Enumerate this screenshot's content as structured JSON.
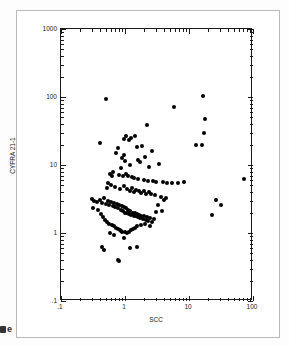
{
  "chart_data": {
    "type": "scatter",
    "title": "",
    "xlabel": "SCC",
    "ylabel": "CYFRA 21-1",
    "xscale": "log",
    "yscale": "log",
    "xlim": [
      0.1,
      100
    ],
    "ylim": [
      0.1,
      1000
    ],
    "grid": false,
    "legend": null,
    "marker": "filled-circle",
    "marker_color": "#000000",
    "x_tick_labels": [
      ".1",
      "1",
      "10",
      "100"
    ],
    "x_tick_values": [
      0.1,
      1,
      10,
      100
    ],
    "y_tick_labels": [
      ".1",
      "1",
      "10",
      "100",
      "1000"
    ],
    "y_tick_values": [
      0.1,
      1,
      10,
      100,
      1000
    ],
    "n_points": 152,
    "points": [
      [
        0.5,
        92.0
      ],
      [
        0.41,
        21.0
      ],
      [
        5.9,
        72.0
      ],
      [
        16.5,
        105.0
      ],
      [
        18.0,
        48.0
      ],
      [
        17.0,
        30.0
      ],
      [
        16.0,
        20.0
      ],
      [
        13.0,
        20.0
      ],
      [
        2.2,
        39.0
      ],
      [
        1.45,
        27.0
      ],
      [
        1.05,
        27.0
      ],
      [
        1.25,
        25.0
      ],
      [
        0.95,
        24.0
      ],
      [
        1.15,
        23.0
      ],
      [
        0.78,
        18.0
      ],
      [
        1.85,
        19.0
      ],
      [
        1.55,
        18.5
      ],
      [
        2.6,
        16.0
      ],
      [
        0.72,
        15.0
      ],
      [
        0.98,
        14.0
      ],
      [
        0.9,
        12.5
      ],
      [
        1.0,
        11.5
      ],
      [
        1.6,
        12.0
      ],
      [
        1.7,
        11.0
      ],
      [
        2.05,
        13.0
      ],
      [
        3.4,
        10.5
      ],
      [
        2.4,
        9.5
      ],
      [
        1.2,
        10.0
      ],
      [
        0.88,
        9.0
      ],
      [
        0.66,
        8.0
      ],
      [
        0.58,
        7.5
      ],
      [
        0.62,
        7.0
      ],
      [
        0.8,
        7.2
      ],
      [
        0.93,
        6.8
      ],
      [
        1.1,
        6.9
      ],
      [
        1.02,
        7.4
      ],
      [
        1.3,
        6.6
      ],
      [
        1.4,
        6.4
      ],
      [
        1.62,
        6.2
      ],
      [
        1.95,
        6.0
      ],
      [
        2.25,
        5.9
      ],
      [
        2.75,
        5.8
      ],
      [
        3.1,
        5.6
      ],
      [
        3.9,
        5.7
      ],
      [
        4.6,
        5.5
      ],
      [
        5.4,
        5.4
      ],
      [
        6.8,
        5.5
      ],
      [
        8.5,
        5.6
      ],
      [
        72.0,
        6.2
      ],
      [
        0.55,
        5.4
      ],
      [
        0.6,
        5.0
      ],
      [
        0.52,
        4.6
      ],
      [
        0.7,
        4.8
      ],
      [
        0.85,
        4.5
      ],
      [
        0.96,
        4.9
      ],
      [
        1.08,
        4.4
      ],
      [
        1.18,
        4.2
      ],
      [
        1.28,
        4.6
      ],
      [
        1.38,
        4.0
      ],
      [
        1.5,
        4.3
      ],
      [
        1.68,
        4.1
      ],
      [
        1.8,
        3.9
      ],
      [
        2.0,
        4.2
      ],
      [
        2.15,
        3.8
      ],
      [
        2.35,
        4.0
      ],
      [
        2.55,
        3.7
      ],
      [
        2.9,
        3.6
      ],
      [
        3.6,
        3.4
      ],
      [
        4.3,
        3.3
      ],
      [
        0.3,
        3.2
      ],
      [
        0.33,
        3.0
      ],
      [
        0.36,
        2.9
      ],
      [
        0.4,
        3.1
      ],
      [
        0.44,
        2.8
      ],
      [
        0.47,
        3.3
      ],
      [
        0.51,
        2.7
      ],
      [
        0.54,
        3.0
      ],
      [
        0.57,
        2.6
      ],
      [
        0.61,
        2.9
      ],
      [
        0.65,
        2.5
      ],
      [
        0.68,
        2.8
      ],
      [
        0.71,
        2.4
      ],
      [
        0.75,
        2.7
      ],
      [
        0.79,
        2.3
      ],
      [
        0.82,
        2.6
      ],
      [
        0.86,
        2.2
      ],
      [
        0.89,
        2.5
      ],
      [
        0.92,
        2.1
      ],
      [
        0.97,
        2.4
      ],
      [
        1.01,
        2.0
      ],
      [
        1.04,
        2.3
      ],
      [
        1.07,
        1.95
      ],
      [
        1.12,
        2.2
      ],
      [
        1.16,
        1.9
      ],
      [
        1.21,
        2.1
      ],
      [
        1.26,
        1.85
      ],
      [
        1.32,
        2.0
      ],
      [
        1.36,
        1.8
      ],
      [
        1.42,
        1.95
      ],
      [
        1.47,
        1.75
      ],
      [
        1.53,
        1.9
      ],
      [
        1.58,
        1.7
      ],
      [
        1.65,
        1.85
      ],
      [
        1.72,
        1.65
      ],
      [
        1.78,
        1.8
      ],
      [
        1.88,
        1.6
      ],
      [
        1.98,
        1.75
      ],
      [
        2.1,
        1.55
      ],
      [
        2.2,
        1.7
      ],
      [
        2.3,
        1.5
      ],
      [
        2.45,
        1.65
      ],
      [
        2.6,
        1.45
      ],
      [
        2.8,
        1.6
      ],
      [
        3.0,
        2.05
      ],
      [
        3.3,
        2.6
      ],
      [
        3.8,
        2.1
      ],
      [
        4.0,
        3.1
      ],
      [
        0.32,
        2.35
      ],
      [
        0.38,
        2.15
      ],
      [
        0.42,
        1.9
      ],
      [
        0.46,
        1.7
      ],
      [
        0.49,
        1.55
      ],
      [
        0.53,
        1.45
      ],
      [
        0.56,
        1.35
      ],
      [
        0.63,
        1.3
      ],
      [
        0.67,
        1.25
      ],
      [
        0.73,
        1.2
      ],
      [
        0.77,
        1.15
      ],
      [
        0.83,
        1.12
      ],
      [
        0.87,
        1.08
      ],
      [
        0.91,
        1.05
      ],
      [
        0.99,
        1.02
      ],
      [
        1.06,
        1.0
      ],
      [
        1.14,
        1.05
      ],
      [
        1.23,
        1.1
      ],
      [
        1.34,
        1.15
      ],
      [
        1.44,
        1.2
      ],
      [
        1.56,
        1.25
      ],
      [
        1.75,
        1.3
      ],
      [
        2.05,
        1.35
      ],
      [
        2.5,
        1.25
      ],
      [
        0.44,
        0.62
      ],
      [
        0.47,
        0.56
      ],
      [
        0.78,
        0.4
      ],
      [
        0.82,
        0.39
      ],
      [
        1.2,
        0.6
      ],
      [
        1.55,
        0.62
      ],
      [
        0.95,
        0.85
      ],
      [
        0.68,
        0.95
      ],
      [
        0.58,
        1.0
      ],
      [
        23.0,
        1.85
      ],
      [
        32.0,
        2.55
      ],
      [
        26.0,
        3.1
      ]
    ]
  },
  "axes": {
    "x_title": "SCC",
    "y_title": "CYFRA 21-1"
  },
  "artifact": {
    "edge_mark": "e"
  }
}
